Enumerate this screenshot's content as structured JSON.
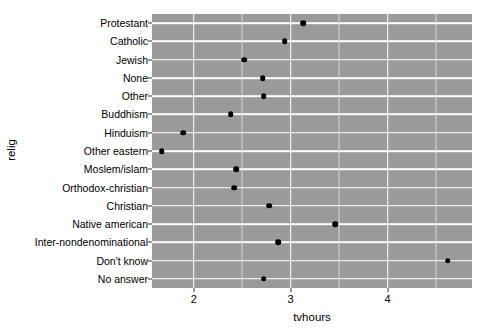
{
  "chart_data": {
    "type": "scatter",
    "title": "",
    "xlabel": "tvhours",
    "ylabel": "relig",
    "orientation": "horizontal",
    "grid": true,
    "legend": "none",
    "panel_background": "#9a9a9a",
    "point_color": "#000000",
    "gridline_color": "#ffffff",
    "xlim": [
      1.57,
      4.87
    ],
    "x_ticks": [
      {
        "value": 2,
        "label": "2"
      },
      {
        "value": 3,
        "label": "3"
      },
      {
        "value": 4,
        "label": "4"
      }
    ],
    "x_minor_ticks": [
      1.5,
      2.5,
      3.5,
      4.5
    ],
    "categories": [
      "Protestant",
      "Catholic",
      "Jewish",
      "None",
      "Other",
      "Buddhism",
      "Hinduism",
      "Other eastern",
      "Moslem/islam",
      "Orthodox-christian",
      "Christian",
      "Native american",
      "Inter-nondenominational",
      "Don't know",
      "No answer"
    ],
    "values": [
      3.13,
      2.94,
      2.52,
      2.71,
      2.72,
      2.38,
      1.89,
      1.67,
      2.44,
      2.42,
      2.78,
      3.46,
      2.87,
      4.62,
      2.72
    ]
  }
}
